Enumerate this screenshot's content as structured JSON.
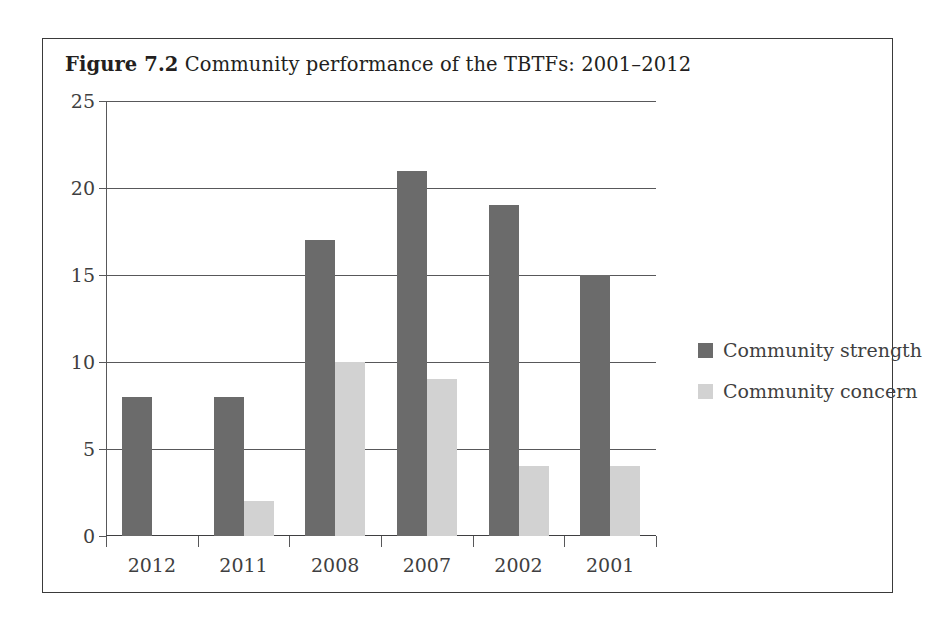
{
  "figure": {
    "caption_label": "Figure 7.2",
    "caption_text": "Community performance of the TBTFs: 2001–2012"
  },
  "chart_data": {
    "type": "bar",
    "title": "Figure 7.2  Community performance of the TBTFs: 2001–2012",
    "xlabel": "",
    "ylabel": "",
    "categories": [
      "2012",
      "2011",
      "2008",
      "2007",
      "2002",
      "2001"
    ],
    "series": [
      {
        "name": "Community strength",
        "color": "#6b6b6b",
        "values": [
          8,
          8,
          17,
          21,
          19,
          15
        ]
      },
      {
        "name": "Community concern",
        "color": "#d2d2d2",
        "values": [
          0,
          2,
          10,
          9,
          4,
          4
        ]
      }
    ],
    "ylim": [
      0,
      25
    ],
    "yticks": [
      0,
      5,
      10,
      15,
      20,
      25
    ],
    "ytick_labels": [
      "0",
      "5",
      "10",
      "15",
      "20",
      "25"
    ],
    "grid": true,
    "legend_position": "right"
  },
  "legend": {
    "items": [
      {
        "label": "Community strength",
        "color": "#6b6b6b"
      },
      {
        "label": "Community concern",
        "color": "#d2d2d2"
      }
    ]
  }
}
